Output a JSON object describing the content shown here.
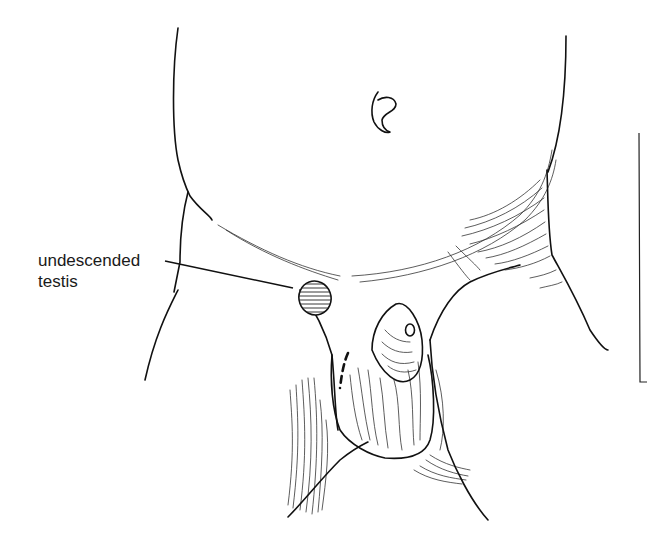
{
  "figure": {
    "labels": [
      {
        "id": "undescended-testis",
        "line1": "undescended",
        "line2": "testis"
      }
    ],
    "colors": {
      "ink": "#111111",
      "background": "#ffffff"
    }
  }
}
